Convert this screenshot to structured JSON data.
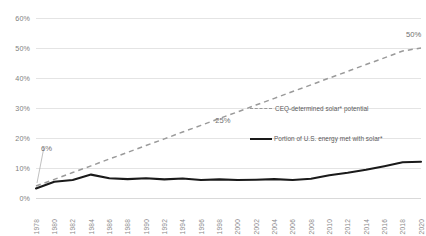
{
  "chart_data": {
    "type": "line",
    "title": "",
    "xlabel": "",
    "ylabel": "",
    "ylim": [
      0,
      60
    ],
    "yticks": [
      0,
      10,
      20,
      30,
      40,
      50,
      60
    ],
    "ytick_labels": [
      "0%",
      "10%",
      "20%",
      "30%",
      "40%",
      "50%",
      "60%"
    ],
    "grid": true,
    "legend_position": "right-inside",
    "x": [
      1978,
      1980,
      1982,
      1984,
      1986,
      1988,
      1990,
      1992,
      1994,
      1996,
      1998,
      2000,
      2002,
      2004,
      2006,
      2008,
      2010,
      2012,
      2014,
      2016,
      2018,
      2020
    ],
    "xtick_labels": [
      "1978",
      "1980",
      "1982",
      "1984",
      "1986",
      "1988",
      "1990",
      "1992",
      "1994",
      "1996",
      "1998",
      "2000",
      "2002",
      "2004",
      "2006",
      "2008",
      "2010",
      "2012",
      "2014",
      "2016",
      "2018",
      "2020"
    ],
    "series": [
      {
        "name": "CEQ-determined solar* potential",
        "style": "dashed",
        "color": "#9a9a9a",
        "values": [
          4.0,
          6.2,
          8.5,
          10.7,
          13.0,
          15.2,
          17.5,
          19.7,
          22.0,
          24.2,
          26.5,
          28.7,
          31.0,
          33.2,
          35.5,
          37.7,
          40.0,
          42.2,
          44.5,
          46.7,
          49.0,
          50.0
        ]
      },
      {
        "name": "Portion of U.S. energy met with solar*",
        "style": "solid",
        "color": "#1a1a1a",
        "values": [
          3.2,
          5.4,
          6.0,
          7.8,
          6.6,
          6.3,
          6.6,
          6.2,
          6.5,
          6.0,
          6.2,
          6.0,
          6.1,
          6.3,
          6.0,
          6.4,
          7.6,
          8.4,
          9.4,
          10.6,
          11.9,
          12.1
        ]
      }
    ],
    "annotations": [
      {
        "text": "6%",
        "x": 1978,
        "y": 6
      },
      {
        "text": "25%",
        "x": 2000,
        "y": 25
      },
      {
        "text": "50%",
        "x": 2020,
        "y": 50
      }
    ]
  },
  "legend": {
    "items": [
      {
        "label": "CEQ-determined solar* potential"
      },
      {
        "label": "Portion of U.S. energy met with solar*"
      }
    ]
  }
}
